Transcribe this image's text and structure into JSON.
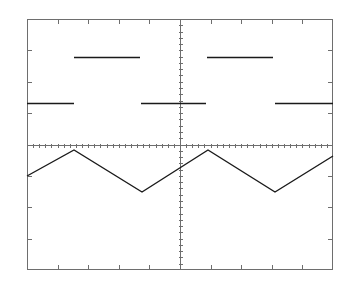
{
  "instrument": {
    "display_type": "oscilloscope-graticule",
    "background_color": "#ffffff",
    "graticule_color": "#6e6e6e",
    "trace_color": "#1a1a1a"
  },
  "graticule": {
    "left": 27,
    "top": 19,
    "right": 333,
    "bottom": 270,
    "width": 306,
    "height": 251,
    "horizontal_divisions": 10,
    "vertical_divisions": 8,
    "division_width_px": 30.6,
    "division_height_px": 31.375,
    "center_x": 180,
    "center_y": 144.5,
    "border_line_width": 1,
    "axis_line_width": 1,
    "minor_ticks_per_division": 5,
    "minor_tick_length": 4,
    "edge_tick_length": 5,
    "show_center_vertical_axis": true,
    "show_center_horizontal_axis": true,
    "show_interior_grid_lines": false
  },
  "chart_data": {
    "type": "line",
    "title": "",
    "xlabel": "",
    "ylabel": "",
    "xlim": [
      0,
      10
    ],
    "ylim": [
      -4,
      4
    ],
    "grid": true,
    "legend": "none",
    "x_unit": "division",
    "y_unit": "division",
    "series": [
      {
        "name": "CH1 square wave",
        "waveform": "square",
        "style": "horizontal-segments-only",
        "high_level_div": 2.8,
        "low_level_div": 1.3,
        "high_level_px_y": 57,
        "low_level_px_y": 103,
        "period_div": 4.35,
        "duty_cycle_percent": 50,
        "segments": [
          {
            "level": "low",
            "x_start_px": 27,
            "x_end_px": 74,
            "y_px": 103
          },
          {
            "level": "high",
            "x_start_px": 74,
            "x_end_px": 140,
            "y_px": 57
          },
          {
            "level": "low",
            "x_start_px": 141,
            "x_end_px": 206,
            "y_px": 103
          },
          {
            "level": "high",
            "x_start_px": 207,
            "x_end_px": 273,
            "y_px": 57
          },
          {
            "level": "low",
            "x_start_px": 275,
            "x_end_px": 333,
            "y_px": 103
          }
        ]
      },
      {
        "name": "CH2 triangle wave",
        "waveform": "triangle",
        "style": "continuous-polyline",
        "peak_px_y": 150,
        "trough_px_y": 192,
        "peak_div": -0.18,
        "trough_div": -1.51,
        "period_div": 4.4,
        "points_px": [
          [
            27,
            176
          ],
          [
            74,
            150
          ],
          [
            142,
            192
          ],
          [
            208,
            150
          ],
          [
            275,
            192
          ],
          [
            333,
            156
          ]
        ]
      }
    ]
  }
}
